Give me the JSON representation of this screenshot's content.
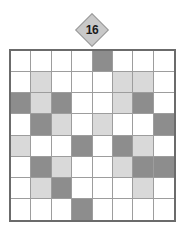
{
  "puzzle": {
    "title": "16",
    "clue_marker": {
      "shape": "diamond",
      "value": "16",
      "column_index": 5,
      "fill_color": "#c9c9c9",
      "border_color": "#9a9a9a",
      "text_color": "#1a1a1a"
    },
    "grid": {
      "rows": 8,
      "columns": 8,
      "border_color": "#6b6b6b",
      "gridline_color": "#9d9d9d",
      "legend": {
        "empty": "#ffffff",
        "light": "#d9d9d9",
        "dark": "#8d8d8d"
      },
      "cells": [
        [
          "empty",
          "empty",
          "empty",
          "empty",
          "dark",
          "empty",
          "empty",
          "empty"
        ],
        [
          "empty",
          "light",
          "empty",
          "empty",
          "empty",
          "light",
          "light",
          "empty"
        ],
        [
          "dark",
          "light",
          "dark",
          "empty",
          "empty",
          "light",
          "dark",
          "empty"
        ],
        [
          "empty",
          "dark",
          "light",
          "empty",
          "light",
          "empty",
          "empty",
          "dark"
        ],
        [
          "light",
          "empty",
          "empty",
          "dark",
          "empty",
          "dark",
          "light",
          "empty"
        ],
        [
          "empty",
          "dark",
          "light",
          "empty",
          "empty",
          "light",
          "dark",
          "dark"
        ],
        [
          "empty",
          "light",
          "dark",
          "empty",
          "empty",
          "empty",
          "light",
          "empty"
        ],
        [
          "empty",
          "empty",
          "empty",
          "dark",
          "empty",
          "empty",
          "empty",
          "empty"
        ]
      ]
    }
  },
  "chart_data": {
    "type": "heatmap",
    "title": "16",
    "xlabel": "",
    "ylabel": "",
    "categories": [
      "1",
      "2",
      "3",
      "4",
      "5",
      "6",
      "7",
      "8"
    ],
    "row_labels": [
      "1",
      "2",
      "3",
      "4",
      "5",
      "6",
      "7",
      "8"
    ],
    "value_map": {
      "empty": 0,
      "light": 1,
      "dark": 2
    },
    "values": [
      [
        0,
        0,
        0,
        0,
        2,
        0,
        0,
        0
      ],
      [
        0,
        1,
        0,
        0,
        0,
        1,
        1,
        0
      ],
      [
        2,
        1,
        2,
        0,
        0,
        1,
        2,
        0
      ],
      [
        0,
        2,
        1,
        0,
        1,
        0,
        0,
        2
      ],
      [
        1,
        0,
        0,
        2,
        0,
        2,
        1,
        0
      ],
      [
        0,
        2,
        1,
        0,
        0,
        1,
        2,
        2
      ],
      [
        0,
        1,
        2,
        0,
        0,
        0,
        1,
        0
      ],
      [
        0,
        0,
        0,
        2,
        0,
        0,
        0,
        0
      ]
    ],
    "colorscale": [
      {
        "value": 0,
        "color": "#ffffff"
      },
      {
        "value": 1,
        "color": "#d9d9d9"
      },
      {
        "value": 2,
        "color": "#8d8d8d"
      }
    ],
    "annotations": [
      {
        "text": "16",
        "shape": "diamond",
        "position": "above-column-5"
      }
    ],
    "grid": true,
    "legend": "none"
  }
}
